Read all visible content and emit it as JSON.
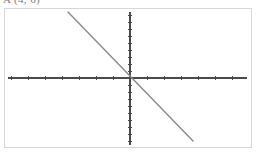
{
  "caption": {
    "text": "A (4, 6)",
    "note": "partially clipped by top edge of image"
  },
  "colors": {
    "background": "#ffffff",
    "frame_border": "#d8d8d8",
    "axis": "#4a4a4a",
    "line": "#8a8a8a"
  },
  "chart_data": {
    "type": "line",
    "title": "A (4, 6)",
    "xlabel": "",
    "ylabel": "",
    "grid": false,
    "legend": null,
    "axes": {
      "origin_px": [
        130,
        78
      ],
      "x_axis": {
        "y_px": 78,
        "x_start_px": 8,
        "x_end_px": 247,
        "tick_spacing_px": 17,
        "tick_length_px": 4,
        "tick_count": 14,
        "labels": []
      },
      "y_axis": {
        "x_px": 130,
        "y_start_px": 12,
        "y_end_px": 145,
        "tick_spacing_px": 7,
        "tick_length_px": 4,
        "tick_count": 19,
        "labels": []
      }
    },
    "series": [
      {
        "name": "line",
        "slope": -1.03,
        "intercept": 0,
        "points_px": [
          [
            68,
            12
          ],
          [
            193,
            141
          ]
        ],
        "x": [
          -3.6,
          3.6
        ],
        "values": [
          9.4,
          -9.6
        ],
        "color": "#8a8a8a",
        "passes_through_origin": true
      }
    ],
    "xlim": [
      -7.2,
      6.9
    ],
    "ylim": [
      -9.6,
      9.4
    ]
  }
}
